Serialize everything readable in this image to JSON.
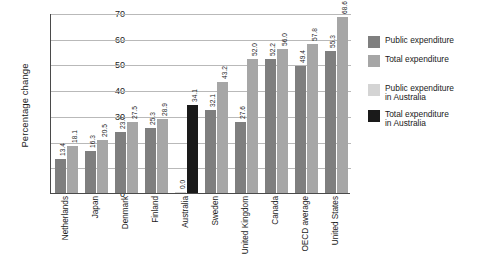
{
  "chart_data": {
    "type": "bar",
    "title": "",
    "xlabel": "",
    "ylabel": "Percentage change",
    "ylim": [
      0,
      70
    ],
    "yticks": [
      "0",
      "10",
      "20",
      "30",
      "40",
      "50",
      "60",
      "70"
    ],
    "grid": true,
    "legend_position": "right",
    "categories": [
      "Netherlands",
      "Japan",
      "Denmark",
      "Finland",
      "Australia",
      "Sweden",
      "United Kingdom",
      "Canada",
      "OECD average",
      "United States"
    ],
    "series": [
      {
        "name": "Public expenditure",
        "color": "#7f7f7f",
        "values": [
          13.4,
          16.3,
          23.7,
          25.3,
          null,
          32.1,
          27.6,
          52.2,
          49.4,
          55.3
        ],
        "labels": [
          "13.4",
          "16.3",
          "23.7",
          "25.3",
          "",
          "32.1",
          "27.6",
          "52.2",
          "49.4",
          "55.3"
        ]
      },
      {
        "name": "Total expenditure",
        "color": "#a6a6a6",
        "values": [
          18.1,
          20.5,
          27.5,
          28.9,
          null,
          43.2,
          52.0,
          56.0,
          57.8,
          68.6
        ],
        "labels": [
          "18.1",
          "20.5",
          "27.5",
          "28.9",
          "",
          "43.2",
          "52.0",
          "56.0",
          "57.8",
          "68.6"
        ]
      },
      {
        "name": "Public expenditure in Australia",
        "color": "#d4d4d4",
        "values": [
          null,
          null,
          null,
          null,
          0.0,
          null,
          null,
          null,
          null,
          null
        ],
        "labels": [
          "",
          "",
          "",
          "",
          "0.0",
          "",
          "",
          "",
          "",
          ""
        ]
      },
      {
        "name": "Total expenditure in Australia",
        "color": "#1a1a1a",
        "values": [
          null,
          null,
          null,
          null,
          34.1,
          null,
          null,
          null,
          null,
          null
        ],
        "labels": [
          "",
          "",
          "",
          "",
          "34.1",
          "",
          "",
          "",
          "",
          ""
        ]
      }
    ]
  },
  "axis": {
    "y_title": "Percentage change",
    "y_ticks": [
      "70",
      "60",
      "50",
      "40",
      "30",
      "20",
      "10",
      "0"
    ]
  },
  "legend": {
    "items": [
      {
        "label_line1": "Public expenditure",
        "label_line2": "",
        "swatch": "public-swatch"
      },
      {
        "label_line1": "Total expenditure",
        "label_line2": "",
        "swatch": "total-swatch"
      },
      {
        "label_line1": "Public expenditure",
        "label_line2": "in Australia",
        "swatch": "public-australia-swatch"
      },
      {
        "label_line1": "Total expenditure",
        "label_line2": "in Australia",
        "swatch": "total-australia-swatch"
      }
    ]
  },
  "bars": {
    "netherlands": {
      "public": "13.4",
      "total": "18.1"
    },
    "japan": {
      "public": "16.3",
      "total": "20.5"
    },
    "denmark": {
      "public": "23.7",
      "total": "27.5"
    },
    "finland": {
      "public": "25.3",
      "total": "28.9"
    },
    "australia": {
      "public": "0.0",
      "total": "34.1"
    },
    "sweden": {
      "public": "32.1",
      "total": "43.2"
    },
    "united_kingdom": {
      "public": "27.6",
      "total": "52.0"
    },
    "canada": {
      "public": "52.2",
      "total": "56.0"
    },
    "oecd_average": {
      "public": "49.4",
      "total": "57.8"
    },
    "united_states": {
      "public": "55.3",
      "total": "68.6"
    }
  }
}
